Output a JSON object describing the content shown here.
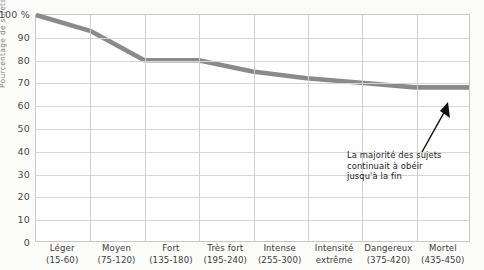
{
  "chart_data": {
    "type": "line",
    "title": "",
    "xlabel": "",
    "ylabel": "Pourcentage de sujets obéissants",
    "ylim": [
      0,
      100
    ],
    "grid": true,
    "legend": false,
    "y_ticks": [
      "100 %",
      "90",
      "80",
      "70",
      "60",
      "50",
      "40",
      "30",
      "20",
      "10",
      "0"
    ],
    "y_tick_values": [
      100,
      90,
      80,
      70,
      60,
      50,
      40,
      30,
      20,
      10,
      0
    ],
    "categories": [
      "Léger",
      "Moyen",
      "Fort",
      "Très fort",
      "Intense",
      "Intensité extrême",
      "Dangereux",
      "Mortel"
    ],
    "category_ranges": [
      "(15-60)",
      "(75-120)",
      "(135-180)",
      "(195-240)",
      "(255-300)",
      "",
      "(375-420)",
      "(435-450)"
    ],
    "values": [
      100,
      93,
      80,
      80,
      75,
      72,
      70,
      68
    ],
    "series_color": "#8a8a8a",
    "annotations": [
      {
        "lines": [
          "La majorité des sujets",
          "continuait à obéir",
          "jusqu'à la fin"
        ],
        "arrow": true,
        "arrow_color": "#111111"
      }
    ]
  }
}
